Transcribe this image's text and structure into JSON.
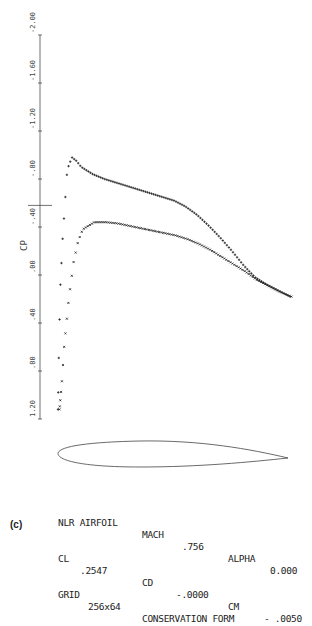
{
  "chart_data": {
    "type": "scatter",
    "title": "",
    "ylabel": "CP",
    "xlabel": "",
    "y_inverted": true,
    "ylim": [
      -2.0,
      1.2
    ],
    "y_ticks": [
      "-2.00",
      "-1.60",
      "-1.20",
      "-.80",
      "-.40",
      ".00",
      ".40",
      ".80",
      "1.20"
    ],
    "critical_cp_marker": -0.58,
    "series": [
      {
        "name": "upper surface",
        "marker": "+",
        "x": [
          0.0,
          0.005,
          0.01,
          0.02,
          0.03,
          0.04,
          0.06,
          0.08,
          0.1,
          0.15,
          0.2,
          0.25,
          0.3,
          0.35,
          0.4,
          0.45,
          0.5,
          0.55,
          0.6,
          0.65,
          0.7,
          0.75,
          0.8,
          0.85,
          0.9,
          0.95,
          1.0
        ],
        "cp": [
          1.12,
          0.5,
          0.1,
          -0.3,
          -0.6,
          -0.88,
          -0.98,
          -0.95,
          -0.9,
          -0.84,
          -0.8,
          -0.77,
          -0.74,
          -0.71,
          -0.68,
          -0.65,
          -0.62,
          -0.57,
          -0.5,
          -0.41,
          -0.31,
          -0.2,
          -0.08,
          0.02,
          0.08,
          0.13,
          0.18
        ]
      },
      {
        "name": "lower surface",
        "marker": "x",
        "x": [
          0.0,
          0.01,
          0.02,
          0.04,
          0.06,
          0.08,
          0.1,
          0.15,
          0.2,
          0.25,
          0.3,
          0.35,
          0.4,
          0.45,
          0.5,
          0.55,
          0.6,
          0.65,
          0.7,
          0.75,
          0.8,
          0.85,
          0.9,
          0.95,
          1.0
        ],
        "cp": [
          1.12,
          0.9,
          0.6,
          0.2,
          -0.1,
          -0.28,
          -0.38,
          -0.44,
          -0.44,
          -0.43,
          -0.41,
          -0.39,
          -0.37,
          -0.35,
          -0.33,
          -0.3,
          -0.26,
          -0.21,
          -0.15,
          -0.09,
          -0.03,
          0.04,
          0.09,
          0.14,
          0.18
        ]
      }
    ],
    "annotations": [
      "airfoil section outline below plot"
    ]
  },
  "info": {
    "line1": {
      "airfoil": "NLR AIRFOIL",
      "mach_label": "MACH",
      "mach": ".756",
      "alpha_label": "ALPHA",
      "alpha": "0.000"
    },
    "line2": {
      "cl_label": "CL",
      "cl": ".2547",
      "cd_label": "CD",
      "cd": "-.0000",
      "cm_label": "CM",
      "cm": "- .0050"
    },
    "line3": {
      "grid_label": "GRID",
      "grid": "256x64",
      "form": "CONSERVATION FORM"
    }
  },
  "figure_label": "(c)"
}
